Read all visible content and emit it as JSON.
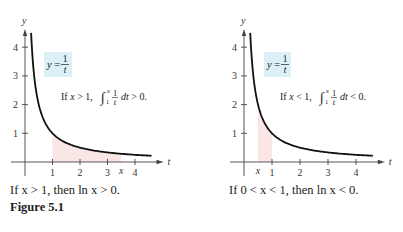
{
  "figure": {
    "label": "Figure 5.1",
    "caption_left": "If x > 1, then ln x > 0.",
    "caption_right": "If 0 < x < 1, then ln x < 0."
  },
  "chart_data": [
    {
      "type": "line",
      "function": "y = 1/t",
      "curve_label": "y = 1/t",
      "annotation": "If x > 1, ∫₁ˣ (1/t) dt > 0.",
      "xlabel": "t",
      "ylabel": "y",
      "x_ticks": [
        1,
        2,
        3,
        4
      ],
      "y_ticks": [
        1,
        2,
        3,
        4
      ],
      "x_marker": {
        "label": "x",
        "value": 3.5
      },
      "shaded_region": {
        "from": 1,
        "to": 3.5,
        "color": "#fbe6e6"
      },
      "xlim": [
        0,
        4.6
      ],
      "ylim": [
        0,
        4.6
      ],
      "label_box_color": "#dcf0f8"
    },
    {
      "type": "line",
      "function": "y = 1/t",
      "curve_label": "y = 1/t",
      "annotation": "If x < 1, ∫₁ˣ (1/t) dt < 0.",
      "xlabel": "t",
      "ylabel": "y",
      "x_ticks": [
        1,
        2,
        3,
        4
      ],
      "y_ticks": [
        1,
        2,
        3,
        4
      ],
      "x_marker": {
        "label": "x",
        "value": 0.5
      },
      "shaded_region": {
        "from": 0.5,
        "to": 1,
        "color": "#fbe6e6"
      },
      "xlim": [
        0,
        4.6
      ],
      "ylim": [
        0,
        4.6
      ],
      "label_box_color": "#dcf0f8"
    }
  ]
}
